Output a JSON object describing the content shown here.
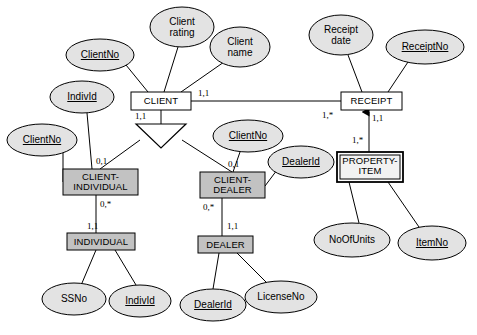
{
  "diagram": {
    "colors": {
      "ellipse_fill": "#e3e3e3",
      "entity_fill_light": "#ffffff",
      "entity_fill_shaded": "#c2c2c2",
      "stroke": "#000000",
      "background": "#ffffff"
    },
    "attributes": [
      {
        "id": "client-no-top",
        "label": "ClientNo",
        "key": true,
        "cx": 100,
        "cy": 55,
        "rx": 34,
        "ry": 16
      },
      {
        "id": "client-rating",
        "label": "Client\nrating",
        "key": false,
        "cx": 182,
        "cy": 27,
        "rx": 32,
        "ry": 20
      },
      {
        "id": "client-name",
        "label": "Client\nname",
        "key": false,
        "cx": 240,
        "cy": 47,
        "rx": 30,
        "ry": 20
      },
      {
        "id": "indiv-id-upper",
        "label": "IndivId",
        "key": true,
        "cx": 82,
        "cy": 97,
        "rx": 32,
        "ry": 16
      },
      {
        "id": "client-no-left",
        "label": "ClientNo",
        "key": true,
        "cx": 42,
        "cy": 140,
        "rx": 35,
        "ry": 16
      },
      {
        "id": "client-no-mid",
        "label": "ClientNo",
        "key": true,
        "cx": 248,
        "cy": 136,
        "rx": 35,
        "ry": 16
      },
      {
        "id": "dealer-id-upper",
        "label": "DealerId",
        "key": true,
        "cx": 301,
        "cy": 162,
        "rx": 33,
        "ry": 16
      },
      {
        "id": "receipt-date",
        "label": "Receipt\ndate",
        "key": false,
        "cx": 341,
        "cy": 35,
        "rx": 32,
        "ry": 20
      },
      {
        "id": "receipt-no",
        "label": "ReceiptNo",
        "key": true,
        "cx": 425,
        "cy": 47,
        "rx": 39,
        "ry": 17
      },
      {
        "id": "no-of-units",
        "label": "NoOfUnits",
        "key": false,
        "cx": 352,
        "cy": 240,
        "rx": 38,
        "ry": 17
      },
      {
        "id": "item-no",
        "label": "ItemNo",
        "key": true,
        "cx": 432,
        "cy": 243,
        "rx": 34,
        "ry": 17
      },
      {
        "id": "ss-no",
        "label": "SSNo",
        "key": false,
        "cx": 74,
        "cy": 299,
        "rx": 32,
        "ry": 16
      },
      {
        "id": "indiv-id-lower",
        "label": "IndivId",
        "key": true,
        "cx": 140,
        "cy": 301,
        "rx": 31,
        "ry": 16
      },
      {
        "id": "dealer-id-lower",
        "label": "DealerId",
        "key": true,
        "cx": 213,
        "cy": 305,
        "rx": 33,
        "ry": 16
      },
      {
        "id": "license-no",
        "label": "LicenseNo",
        "key": false,
        "cx": 281,
        "cy": 297,
        "rx": 36,
        "ry": 16
      }
    ],
    "entities": [
      {
        "id": "client",
        "label": "CLIENT",
        "style": "light",
        "x": 131,
        "y": 92,
        "w": 60,
        "h": 18
      },
      {
        "id": "receipt",
        "label": "RECEIPT",
        "style": "light",
        "x": 341,
        "y": 92,
        "w": 61,
        "h": 18
      },
      {
        "id": "property-item",
        "label": "PROPERTY-\nITEM",
        "style": "weak",
        "x": 337,
        "y": 152,
        "w": 66,
        "h": 30
      },
      {
        "id": "client-individual",
        "label": "CLIENT-\nINDIVIDUAL",
        "style": "shaded",
        "x": 63,
        "y": 169,
        "w": 75,
        "h": 26
      },
      {
        "id": "client-dealer",
        "label": "CLIENT-\nDEALER",
        "style": "shaded",
        "x": 200,
        "y": 172,
        "w": 65,
        "h": 26
      },
      {
        "id": "individual",
        "label": "INDIVIDUAL",
        "style": "shaded",
        "x": 67,
        "y": 233,
        "w": 68,
        "h": 17
      },
      {
        "id": "dealer",
        "label": "DEALER",
        "style": "shaded",
        "x": 198,
        "y": 236,
        "w": 55,
        "h": 17
      }
    ],
    "cardinalities": [
      {
        "id": "client-right",
        "label": "1,1",
        "x": 198,
        "y": 88
      },
      {
        "id": "client-below",
        "label": "1,1",
        "x": 135,
        "y": 111
      },
      {
        "id": "receipt-left",
        "label": "1,*",
        "x": 322,
        "y": 110
      },
      {
        "id": "receipt-below",
        "label": "1,1",
        "x": 372,
        "y": 113
      },
      {
        "id": "property-item-above",
        "label": "1,*",
        "x": 352,
        "y": 135
      },
      {
        "id": "client-individual-top",
        "label": "0,1",
        "x": 96,
        "y": 156
      },
      {
        "id": "client-dealer-top",
        "label": "0,1",
        "x": 228,
        "y": 159
      },
      {
        "id": "client-individual-bot",
        "label": "0,*",
        "x": 100,
        "y": 199
      },
      {
        "id": "client-dealer-bot",
        "label": "0,*",
        "x": 203,
        "y": 202
      },
      {
        "id": "individual-top",
        "label": "1,1",
        "x": 87,
        "y": 221
      },
      {
        "id": "dealer-top",
        "label": "1,1",
        "x": 227,
        "y": 221
      }
    ],
    "connectors": [
      {
        "id": "clientno-to-client",
        "from": "client-no-top",
        "to": "client"
      },
      {
        "id": "clientrating-to-client",
        "from": "client-rating",
        "to": "client"
      },
      {
        "id": "clientname-to-client",
        "from": "client-name",
        "to": "client"
      },
      {
        "id": "client-to-receipt",
        "from": "client",
        "to": "receipt"
      },
      {
        "id": "receiptdate-to-receipt",
        "from": "receipt-date",
        "to": "receipt"
      },
      {
        "id": "receiptno-to-receipt",
        "from": "receipt-no",
        "to": "receipt"
      },
      {
        "id": "propertyitem-to-receipt",
        "from": "property-item",
        "to": "receipt",
        "arrow": true
      },
      {
        "id": "noofunits-to-propertyitem",
        "from": "no-of-units",
        "to": "property-item"
      },
      {
        "id": "itemno-to-propertyitem",
        "from": "item-no",
        "to": "property-item"
      },
      {
        "id": "client-to-isa",
        "from": "client",
        "to": "isa-triangle"
      },
      {
        "id": "isa-to-clientindividual",
        "from": "isa-triangle",
        "to": "client-individual"
      },
      {
        "id": "isa-to-clientdealer",
        "from": "isa-triangle",
        "to": "client-dealer"
      },
      {
        "id": "individ-to-clientindividual",
        "from": "indiv-id-upper",
        "to": "client-individual"
      },
      {
        "id": "clientno-to-clientindividual",
        "from": "client-no-left",
        "to": "client-individual"
      },
      {
        "id": "clientno-to-clientdealer",
        "from": "client-no-mid",
        "to": "client-dealer"
      },
      {
        "id": "dealerid-to-clientdealer",
        "from": "dealer-id-upper",
        "to": "client-dealer"
      },
      {
        "id": "clientindividual-to-individual",
        "from": "client-individual",
        "to": "individual"
      },
      {
        "id": "clientdealer-to-dealer",
        "from": "client-dealer",
        "to": "dealer"
      },
      {
        "id": "ssno-to-individual",
        "from": "ss-no",
        "to": "individual"
      },
      {
        "id": "individ-to-individual",
        "from": "indiv-id-lower",
        "to": "individual"
      },
      {
        "id": "dealerid-to-dealer",
        "from": "dealer-id-lower",
        "to": "dealer"
      },
      {
        "id": "licenseno-to-dealer",
        "from": "license-no",
        "to": "dealer"
      }
    ],
    "isa": {
      "id": "isa-triangle",
      "label": "",
      "apex_x": 161,
      "apex_y": 148,
      "left_x": 136,
      "right_x": 186,
      "top_y": 124
    }
  }
}
